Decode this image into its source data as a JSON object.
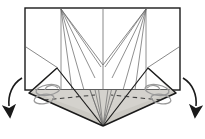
{
  "figure": {
    "title": "Origami fold step diagram",
    "caption": "",
    "background_color": "#ffffff",
    "width": 205,
    "height": 139
  },
  "colors": {
    "outline": "#1a1a1a",
    "thin_line": "#6b6b6b",
    "crease_line": "#8a8a8a",
    "flap_fill": "#d4d2cd",
    "flap_fill_dark": "#c3c1bb",
    "dashed_line": "#4a4a4a",
    "arrow": "#1a1a1a",
    "spiral": "#9a9a9a",
    "paper_fill": "#ffffff"
  },
  "geometry": {
    "sheet": {
      "label": "paper-sheet",
      "left": 25,
      "right": 180,
      "top": 8,
      "bottom": 90
    },
    "center_x": 103,
    "fan_left_origin": {
      "x": 61,
      "y": 9
    },
    "fan_right_origin": {
      "x": 146,
      "y": 9
    },
    "v_vertex": {
      "x": 103,
      "y": 65
    },
    "apex": {
      "x": 103,
      "y": 126
    },
    "left_flap_tip": {
      "x": 29,
      "y": 93
    },
    "right_flap_tip": {
      "x": 176,
      "y": 93
    },
    "left_flap_corner": {
      "x": 57,
      "y": 68
    },
    "right_flap_corner": {
      "x": 148,
      "y": 68
    }
  },
  "elements": {
    "sheet_outline": "paper-sheet-outline",
    "left_fan": "left-crease-fan",
    "right_fan": "right-crease-fan",
    "center_line": "center-vertical-crease",
    "v_crease": "center-v-crease",
    "left_flap": "left-folded-flap",
    "right_flap": "right-folded-flap",
    "left_dashed": "left-hidden-fold-dashed",
    "right_dashed": "right-hidden-fold-dashed",
    "left_spiral": "left-twist-spiral-mark",
    "right_spiral": "right-twist-spiral-mark",
    "left_arrow": "left-fold-direction-arrow",
    "right_arrow": "right-fold-direction-arrow"
  },
  "annotations": {
    "left_arrow_meaning": "fold down and outward",
    "right_arrow_meaning": "fold down and outward"
  }
}
